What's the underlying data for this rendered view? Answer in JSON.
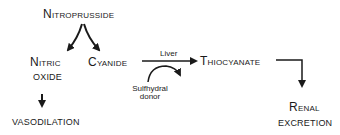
{
  "diagram": {
    "nodes": {
      "nitroprusside": {
        "label": "Nitroprusside"
      },
      "nitric_oxide_line1": {
        "label": "Nitric"
      },
      "nitric_oxide_line2": {
        "label": "OXIDE"
      },
      "cyanide": {
        "label": "Cyanide"
      },
      "thiocyanate": {
        "label": "Thiocyanate"
      },
      "vasodilation": {
        "label": "VASODILATION"
      },
      "renal_line1": {
        "label": "Renal"
      },
      "renal_line2": {
        "label": "EXCRETION"
      },
      "sulfhydral_line1": {
        "label": "Sulfhydral"
      },
      "sulfhydral_line2": {
        "label": "donor"
      }
    },
    "edges": [
      {
        "from": "Nitroprusside",
        "to": "Nitric oxide"
      },
      {
        "from": "Nitroprusside",
        "to": "Cyanide"
      },
      {
        "from": "Cyanide",
        "to": "Thiocyanate",
        "label": "Liver"
      },
      {
        "from": "Sulfhydral donor",
        "to": "Cyanide→Thiocyanate reaction"
      },
      {
        "from": "Nitric oxide",
        "to": "Vasodilation"
      },
      {
        "from": "Thiocyanate",
        "to": "Renal excretion"
      }
    ],
    "edge_labels": {
      "liver": "Liver"
    },
    "colors": {
      "ink": "#1a1a1a",
      "background": "#ffffff"
    }
  }
}
